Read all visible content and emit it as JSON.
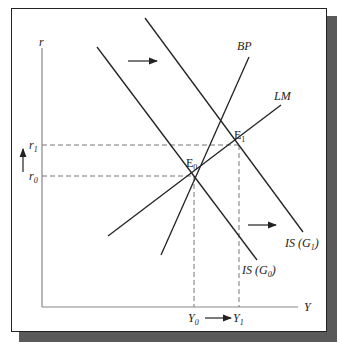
{
  "diagram": {
    "type": "IS-LM-BP model, fiscal expansion",
    "axes": {
      "y_label": "r",
      "x_label": "Y"
    },
    "curves": [
      {
        "id": "is_g0",
        "label": "IS (G",
        "sub": "0",
        "suffix": ")"
      },
      {
        "id": "is_g1",
        "label": "IS (G",
        "sub": "1",
        "suffix": ")"
      },
      {
        "id": "bp",
        "label": "BP"
      },
      {
        "id": "lm",
        "label": "LM"
      }
    ],
    "points": [
      {
        "id": "e0",
        "label": "E",
        "sub": "0"
      },
      {
        "id": "e1",
        "label": "E",
        "sub": "1"
      }
    ],
    "y_ticks": [
      {
        "label": "r",
        "sub": "1"
      },
      {
        "label": "r",
        "sub": "0"
      }
    ],
    "x_ticks": [
      {
        "label": "Y",
        "sub": "0"
      },
      {
        "label": "Y",
        "sub": "1"
      }
    ],
    "colors": {
      "line": "#222222",
      "axis": "#888888",
      "dash": "#777777",
      "shadow": "#5a5a5a"
    }
  }
}
